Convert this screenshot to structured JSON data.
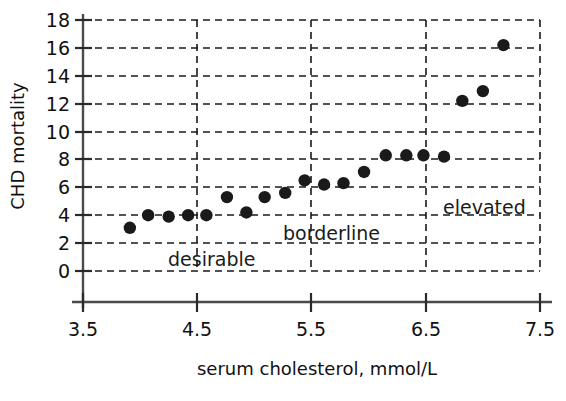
{
  "chart_data": {
    "type": "scatter",
    "title": "",
    "xlabel": "serum cholesterol, mmol/L",
    "ylabel": "CHD mortality",
    "xlim": [
      3.5,
      7.5
    ],
    "ylim": [
      0,
      18
    ],
    "xticks": [
      "3.5",
      "4.5",
      "5.5",
      "6.5",
      "7.5"
    ],
    "xtick_values": [
      3.5,
      4.5,
      5.5,
      6.5,
      7.5
    ],
    "yticks": [
      "0",
      "2",
      "4",
      "6",
      "8",
      "10",
      "12",
      "14",
      "16",
      "18"
    ],
    "ytick_values": [
      0,
      2,
      4,
      6,
      8,
      10,
      12,
      14,
      16,
      18
    ],
    "grid": "dashed, both axes",
    "legend": "none",
    "marker": "filled circle",
    "marker_color": "#1a1a1a",
    "points": [
      {
        "x": 3.91,
        "y": 3.1
      },
      {
        "x": 4.07,
        "y": 4.0
      },
      {
        "x": 4.25,
        "y": 3.9
      },
      {
        "x": 4.42,
        "y": 4.0
      },
      {
        "x": 4.58,
        "y": 4.0
      },
      {
        "x": 4.76,
        "y": 5.3
      },
      {
        "x": 4.93,
        "y": 4.2
      },
      {
        "x": 5.09,
        "y": 5.3
      },
      {
        "x": 5.27,
        "y": 5.6
      },
      {
        "x": 5.44,
        "y": 6.5
      },
      {
        "x": 5.61,
        "y": 6.2
      },
      {
        "x": 5.78,
        "y": 6.3
      },
      {
        "x": 5.96,
        "y": 7.1
      },
      {
        "x": 6.15,
        "y": 8.3
      },
      {
        "x": 6.33,
        "y": 8.3
      },
      {
        "x": 6.48,
        "y": 8.3
      },
      {
        "x": 6.66,
        "y": 8.2
      },
      {
        "x": 6.82,
        "y": 12.2
      },
      {
        "x": 7.0,
        "y": 12.9
      },
      {
        "x": 7.18,
        "y": 16.2
      }
    ],
    "annotations": [
      {
        "text": "desirable",
        "x": 4.2,
        "y": 1.0
      },
      {
        "text": "borderline",
        "x": 5.2,
        "y": 2.2
      },
      {
        "text": "elevated",
        "x": 6.6,
        "y": 4.0
      }
    ],
    "zone_boundaries": [
      4.5,
      5.5,
      6.5
    ]
  },
  "axes": {
    "y_title": "CHD mortality",
    "x_title": "serum cholesterol, mmol/L"
  }
}
